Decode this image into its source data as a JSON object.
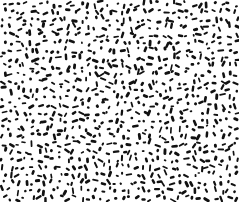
{
  "image": {
    "kind": "texture",
    "description": "Random black dash/blob speckle pattern on white background",
    "width": 239,
    "height": 202,
    "background": "#ffffff",
    "ink": "#111111",
    "mark_count": 900,
    "seed": 1337,
    "mark_length_range": [
      2.5,
      7
    ],
    "mark_thickness_range": [
      1.6,
      3.0
    ]
  }
}
